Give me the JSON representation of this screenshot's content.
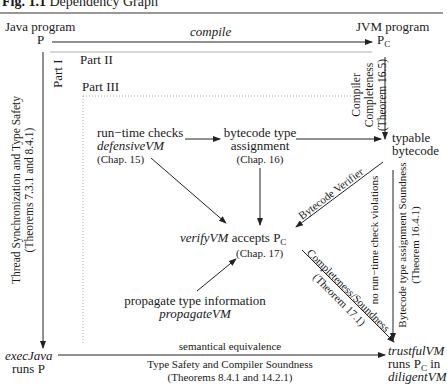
{
  "figure": {
    "label": "Fig. 1.1",
    "title": "Dependency Graph"
  },
  "nodes": {
    "java_program": {
      "line1": "Java program",
      "line2": "P"
    },
    "jvm_program": {
      "line1": "JVM program",
      "line2": "P",
      "sub": "C"
    },
    "runtime_checks": {
      "line1": "run−time checks",
      "line2": "defensiveVM",
      "line3": "(Chap. 15)"
    },
    "bytecode_type_assignment": {
      "line1": "bytecode type",
      "line2": "assignment",
      "line3": "(Chap. 16)"
    },
    "typable_bytecode": {
      "line1": "typable",
      "line2": "bytecode"
    },
    "verify_vm": {
      "name": "verifyVM",
      "text": "accepts P",
      "sub": "C",
      "chap": "(Chap. 17)"
    },
    "propagate": {
      "line1": "propagate type information",
      "line2": "propagateVM"
    },
    "exec_java": {
      "line1": "execJava",
      "line2": "runs P"
    },
    "trustful_vm": {
      "line1": "trustfulVM",
      "line2": "runs P",
      "sub": "C",
      "line2b": " in",
      "line3": "diligentVM"
    }
  },
  "parts": {
    "part1": "Part I",
    "part2": "Part II",
    "part3": "Part III"
  },
  "edges": {
    "compile": "compile",
    "compiler_completeness": {
      "line1": "Compiler",
      "line2": "Completeness",
      "line3": "(Theorem 16.5)"
    },
    "thread_sync": {
      "line1": "Thread Synchronization and Type Safety",
      "line2": "(Theorems 7.3.1 and 8.4.1)"
    },
    "bytecode_verifier": "Bytecode Verifier",
    "no_runtime_check": "no run−time check violations",
    "bytecode_soundness": {
      "line1": "Bytecode type assignment Soundness",
      "line2": "(Theorem 16.4.1)"
    },
    "completeness_soundness": {
      "line1": "Completeness/Soundness",
      "line2": "(Theorem 17.1)"
    },
    "semantical_equivalence": "semantical equivalence",
    "type_safety": {
      "line1": "Type Safety and Compiler Soundness",
      "line2": "(Theorems 8.4.1 and 14.2.1)"
    }
  }
}
